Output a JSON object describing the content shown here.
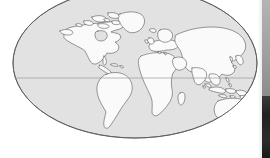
{
  "figure": {
    "name": "world-map-mollweide",
    "projection": "Mollweide",
    "background_color": "#ffffff",
    "ocean_color": "#e2e2e2",
    "ocean_edge_color": "#5a5a5a",
    "land_color": "#fafafa",
    "land_outline_color": "#4a4a4a",
    "arid_shading_color": "#efefef",
    "graticule_color": "#9a9a9a",
    "ellipse": {
      "center_x": 135,
      "center_y": 63,
      "radius_x": 122,
      "radius_y": 75
    },
    "equator": {
      "label": "equator",
      "y": 78,
      "visible": true
    },
    "graticule": {
      "visible": true,
      "lines": [
        "equator"
      ]
    }
  },
  "landmasses": [
    {
      "name": "north-america",
      "label": "North America"
    },
    {
      "name": "greenland",
      "label": "Greenland"
    },
    {
      "name": "canadian-arctic-islands",
      "label": "Canadian Arctic Archipelago"
    },
    {
      "name": "south-america",
      "label": "South America"
    },
    {
      "name": "africa",
      "label": "Africa"
    },
    {
      "name": "madagascar",
      "label": "Madagascar"
    },
    {
      "name": "europe",
      "label": "Europe"
    },
    {
      "name": "british-isles",
      "label": "British Isles"
    },
    {
      "name": "scandinavia",
      "label": "Scandinavia"
    },
    {
      "name": "asia",
      "label": "Asia"
    },
    {
      "name": "arabian-peninsula",
      "label": "Arabian Peninsula"
    },
    {
      "name": "india",
      "label": "India"
    },
    {
      "name": "japan",
      "label": "Japan"
    },
    {
      "name": "indonesia",
      "label": "Indonesia"
    },
    {
      "name": "philippines",
      "label": "Philippines"
    },
    {
      "name": "australia",
      "label": "Australia"
    },
    {
      "name": "new-zealand",
      "label": "New Zealand"
    },
    {
      "name": "iceland",
      "label": "Iceland"
    }
  ],
  "arid_regions": [
    {
      "name": "sahara-shading",
      "label": "Sahara"
    },
    {
      "name": "arabian-shading",
      "label": "Arabian Desert"
    },
    {
      "name": "central-asia-shading",
      "label": "Central Asia"
    },
    {
      "name": "gobi-shading",
      "label": "Gobi"
    },
    {
      "name": "kalahari-shading",
      "label": "Kalahari"
    },
    {
      "name": "australia-shading",
      "label": "Australian Outback"
    }
  ],
  "side_panel": {
    "name": "clipped-side-panel",
    "visible": true,
    "light_strip_color": "#ececec",
    "gray_strip_color": "#9f9f9f",
    "dark_strip_color": "#222222"
  }
}
